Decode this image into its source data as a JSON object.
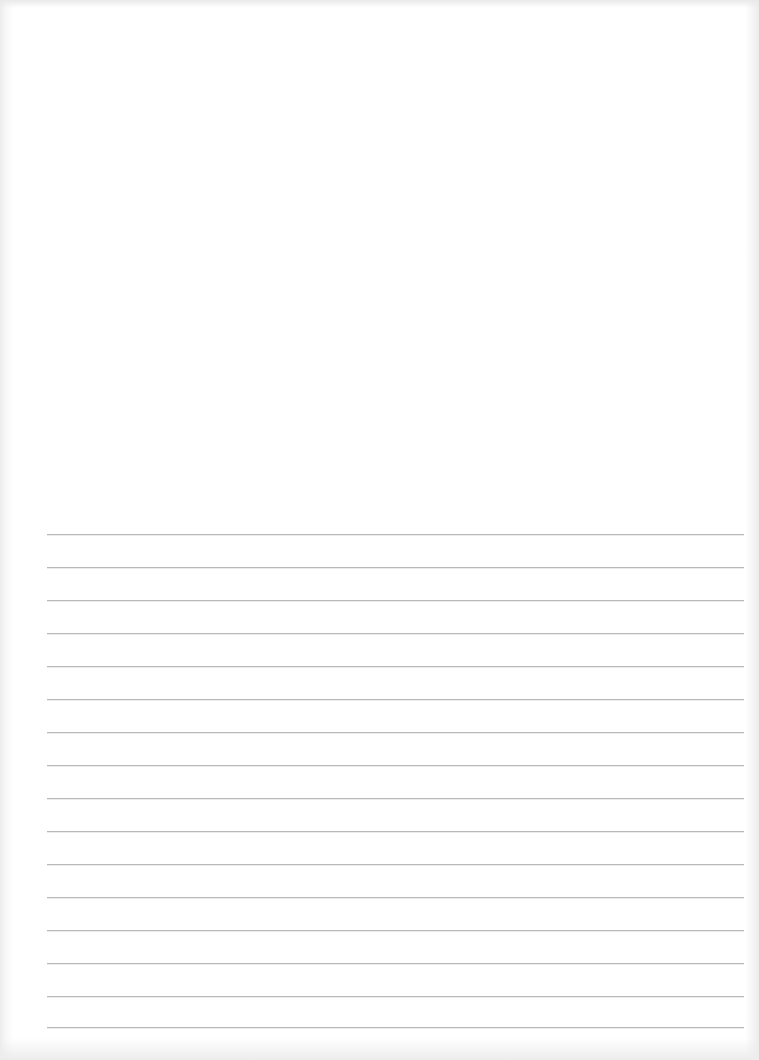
{
  "document": {
    "type": "lined-paper",
    "text_content": "",
    "background_color": "#ffffff",
    "line_color": "#b9b9b9"
  },
  "header_area": {
    "text": ""
  },
  "rules": {
    "count": 16,
    "left_px": 47,
    "right_px": 744,
    "first_line_y": 534,
    "spacing_px": 33,
    "lines": [
      {
        "index": 1,
        "y": 534,
        "text": ""
      },
      {
        "index": 2,
        "y": 567,
        "text": ""
      },
      {
        "index": 3,
        "y": 600,
        "text": ""
      },
      {
        "index": 4,
        "y": 633,
        "text": ""
      },
      {
        "index": 5,
        "y": 666,
        "text": ""
      },
      {
        "index": 6,
        "y": 699,
        "text": ""
      },
      {
        "index": 7,
        "y": 732,
        "text": ""
      },
      {
        "index": 8,
        "y": 765,
        "text": ""
      },
      {
        "index": 9,
        "y": 798,
        "text": ""
      },
      {
        "index": 10,
        "y": 831,
        "text": ""
      },
      {
        "index": 11,
        "y": 864,
        "text": ""
      },
      {
        "index": 12,
        "y": 897,
        "text": ""
      },
      {
        "index": 13,
        "y": 930,
        "text": ""
      },
      {
        "index": 14,
        "y": 963,
        "text": ""
      },
      {
        "index": 15,
        "y": 996,
        "text": ""
      },
      {
        "index": 16,
        "y": 1027,
        "text": ""
      }
    ]
  }
}
